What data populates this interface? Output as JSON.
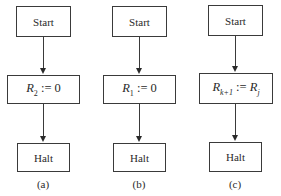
{
  "diagrams": [
    {
      "caption": "(a)",
      "start": "Start",
      "instruction": {
        "reg": "R",
        "reg_sub": "2",
        "op": " := ",
        "rhs": "0"
      },
      "halt": "Halt"
    },
    {
      "caption": "(b)",
      "start": "Start",
      "instruction": {
        "reg": "R",
        "reg_sub": "1",
        "op": " := ",
        "rhs": "0"
      },
      "halt": "Halt"
    },
    {
      "caption": "(c)",
      "start": "Start",
      "instruction": {
        "reg": "R",
        "reg_sub": "k+1",
        "op": " := ",
        "rhs": "R",
        "rhs_sub": "j"
      },
      "halt": "Halt"
    }
  ]
}
